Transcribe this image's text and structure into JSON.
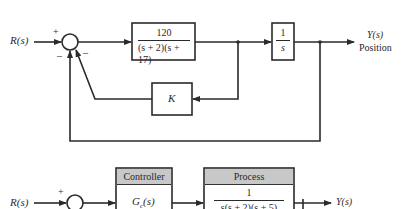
{
  "top_diagram": {
    "input_label": "R(s)",
    "sum_signs": {
      "top": "+",
      "left_bottom": "–",
      "right_bottom": "–"
    },
    "forward_block": {
      "numerator": "120",
      "denominator": "(s + 2)(s + 17)"
    },
    "integrator_block": {
      "numerator": "1",
      "denominator": "s"
    },
    "feedback_block": {
      "label": "K"
    },
    "output_label": "Y(s)",
    "output_caption": "Position"
  },
  "bottom_diagram": {
    "input_label": "R(s)",
    "sum_signs": {
      "top": "+"
    },
    "controller": {
      "header": "Controller",
      "label": "G",
      "subscript": "c",
      "arg": "(s)"
    },
    "process": {
      "header": "Process",
      "numerator": "1",
      "denominator": "s(s + 2)(s + 5)"
    },
    "output_label": "Y(s)"
  },
  "colors": {
    "line": "#2a2a2a",
    "header_fill": "#c8c8c8",
    "background": "#ffffff"
  }
}
